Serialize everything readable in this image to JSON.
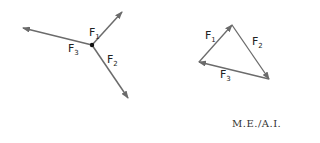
{
  "left_diagram": {
    "title": "Forces at a point",
    "labels": [
      {
        "base": "F",
        "sub": "1"
      },
      {
        "base": "F",
        "sub": "2"
      },
      {
        "base": "F",
        "sub": "3"
      }
    ]
  },
  "right_diagram": {
    "title": "Force triangle",
    "labels": [
      {
        "base": "F",
        "sub": "1"
      },
      {
        "base": "F",
        "sub": "2"
      },
      {
        "base": "F",
        "sub": "3"
      }
    ]
  },
  "credit": "M.E./A.I.",
  "colors": {
    "arrow": "#6b6b6b",
    "point": "#111111",
    "text": "#222222"
  }
}
